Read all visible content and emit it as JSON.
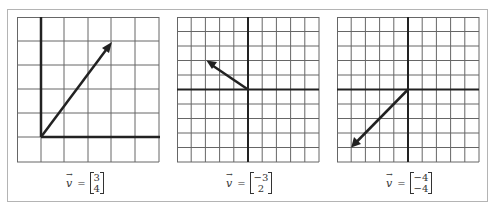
{
  "figure": {
    "panels": [
      {
        "id": "left",
        "grid": {
          "cols": 6,
          "rows": 6,
          "origin_col": 1,
          "origin_row": 5,
          "axis_extent": "positive-quadrant"
        },
        "vector": {
          "x": 3,
          "y": 4
        },
        "label": {
          "symbol": "v",
          "arrow": "→",
          "equals": "=",
          "top": "3",
          "bottom": "4"
        }
      },
      {
        "id": "middle",
        "grid": {
          "cols": 10,
          "rows": 10,
          "origin_col": 5,
          "origin_row": 5,
          "axis_extent": "full"
        },
        "vector": {
          "x": -3,
          "y": 2
        },
        "label": {
          "symbol": "v",
          "arrow": "→",
          "equals": "=",
          "top": "−3",
          "bottom": "2"
        }
      },
      {
        "id": "right",
        "grid": {
          "cols": 10,
          "rows": 10,
          "origin_col": 5,
          "origin_row": 5,
          "axis_extent": "full"
        },
        "vector": {
          "x": -4,
          "y": -4
        },
        "label": {
          "symbol": "v",
          "arrow": "→",
          "equals": "=",
          "top": "−4",
          "bottom": "−4"
        }
      }
    ],
    "colors": {
      "grid": "#555555",
      "axis": "#222222",
      "vector": "#222222",
      "frame": "#b4b4b4"
    }
  }
}
